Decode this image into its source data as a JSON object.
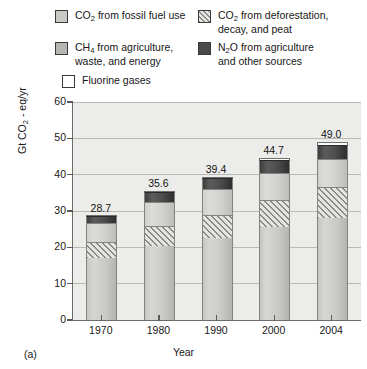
{
  "panel_label": "(a)",
  "legend": {
    "entries": [
      {
        "id": "fossil",
        "swatch": "light-gray-solid-swatch",
        "line1": "CO",
        "sub1": "2",
        "line1b": " from fossil fuel use",
        "line2": ""
      },
      {
        "id": "deforestation",
        "swatch": "diagonal-hatch-swatch",
        "line1": "CO",
        "sub1": "2",
        "line1b": " from deforestation,",
        "line2": "decay, and peat"
      },
      {
        "id": "ch4",
        "swatch": "medium-gray-solid-swatch",
        "line1": "CH",
        "sub1": "4",
        "line1b": " from agriculture,",
        "line2": "waste, and energy"
      },
      {
        "id": "n2o",
        "swatch": "dark-gray-solid-swatch",
        "line1": "N",
        "sub1": "2",
        "line1b": "O from agriculture",
        "line2": "and other sources"
      },
      {
        "id": "fluorine",
        "swatch": "white-outline-swatch",
        "line1": "Fluorine gases",
        "sub1": "",
        "line1b": "",
        "line2": ""
      }
    ]
  },
  "chart_data": {
    "type": "bar",
    "subtype": "stacked-column",
    "title": "",
    "xlabel": "Year",
    "ylabel_parts": {
      "pre": "Gt CO",
      "sub": "2",
      "post": " - eq/yr"
    },
    "ylabel": "Gt CO2 - eq/yr",
    "categories": [
      "1970",
      "1980",
      "1990",
      "2000",
      "2004"
    ],
    "ylim": [
      0,
      60
    ],
    "yticks": [
      0,
      10,
      20,
      30,
      40,
      50,
      60
    ],
    "ytick_labels": [
      "0",
      "10",
      "20",
      "30",
      "40",
      "50",
      "60"
    ],
    "grid": true,
    "legend_position": "above-plot",
    "totals": [
      28.7,
      35.6,
      39.4,
      44.7,
      49.0
    ],
    "total_labels": [
      "28.7",
      "35.6",
      "39.4",
      "44.7",
      "49.0"
    ],
    "series": [
      {
        "name": "CO2 from fossil fuel use",
        "key": "fossil",
        "color": "#c9c9c6",
        "values": [
          17.0,
          20.5,
          22.5,
          25.5,
          28.0
        ]
      },
      {
        "name": "CO2 from deforestation, decay, and peat",
        "key": "deforestation",
        "color": "#8d8d8a",
        "pattern": "diagonal-hatch",
        "values": [
          4.5,
          5.5,
          6.5,
          7.5,
          8.5
        ]
      },
      {
        "name": "CH4 from agriculture, waste, and energy",
        "key": "ch4",
        "color": "#d2d2cf",
        "values": [
          5.2,
          6.5,
          7.0,
          7.5,
          7.9
        ]
      },
      {
        "name": "N2O from agriculture and other sources",
        "key": "n2o",
        "color": "#4a4a4a",
        "values": [
          1.8,
          2.8,
          3.0,
          3.5,
          3.8
        ]
      },
      {
        "name": "Fluorine gases",
        "key": "fluorine",
        "color": "#ffffff",
        "values": [
          0.2,
          0.3,
          0.4,
          0.7,
          0.8
        ]
      }
    ]
  }
}
